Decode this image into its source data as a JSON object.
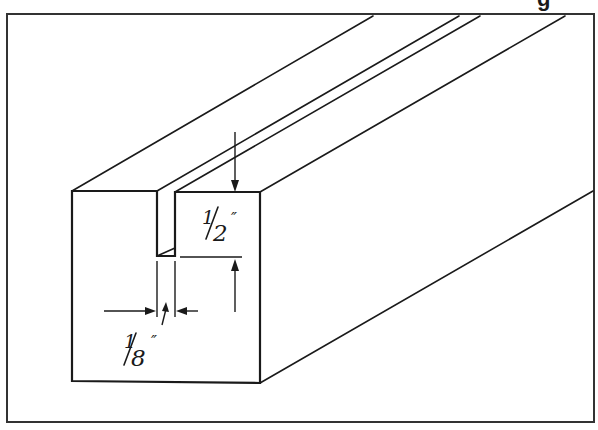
{
  "figure": {
    "type": "isometric technical drawing",
    "cropped_top_text": "g",
    "colors": {
      "ink": "#1a1a1a",
      "frame": "#333333",
      "background": "#ffffff"
    }
  },
  "dimensions": {
    "slot_depth": {
      "label": "1/2\"",
      "numerator": "1",
      "denominator": "2",
      "unit_mark": "″",
      "description": "depth of slot"
    },
    "slot_width": {
      "label": "1/8\"",
      "numerator": "1",
      "denominator": "8",
      "unit_mark": "″",
      "description": "width of slot"
    }
  }
}
